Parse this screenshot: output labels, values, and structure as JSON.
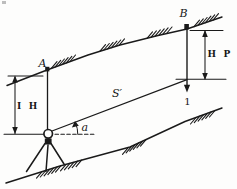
{
  "diagram": {
    "points": {
      "a": "A",
      "b": "B"
    },
    "measurements": {
      "instrument_height": "I H",
      "prism_height": "H P",
      "slope_distance": "S′",
      "vertical_angle": "a",
      "target_point": "1"
    },
    "colors": {
      "ink": "#1a1a1a",
      "paper": "#fdfdfc"
    }
  }
}
